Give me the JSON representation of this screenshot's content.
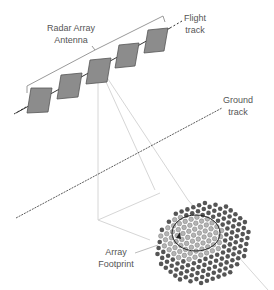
{
  "diagram": {
    "labels": {
      "antenna_line1": "Radar Array",
      "antenna_line2": "Antenna",
      "flight_line1": "Flight",
      "flight_line2": "track",
      "ground_line1": "Ground",
      "ground_line2": "track",
      "footprint_line1": "Array",
      "footprint_line2": "Footprint"
    },
    "colors": {
      "panel_fill": "#8c8c8c",
      "panel_stroke": "#555555",
      "dot_dark": "#555555",
      "dot_light": "#b4b4b4",
      "beam_line": "#d6d6d6",
      "track_line": "#333333",
      "bracket": "#9a9a9a"
    },
    "panel_count": 5
  }
}
